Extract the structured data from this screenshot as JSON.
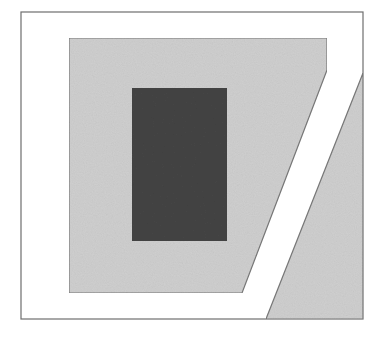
{
  "figure": {
    "colors": {
      "background": "#ffffff",
      "frame_stroke": "#6e6e6e",
      "light_fill": "#cfcfcf",
      "dark_fill": "#444444",
      "edge_stroke": "#7a7a7a"
    },
    "outer_frame": {
      "x": 21,
      "y": 12,
      "width": 342,
      "height": 307
    },
    "inner_shape_points": "69,38 327,38 327,70 242,293 69,293",
    "dark_rect": {
      "x": 132,
      "y": 88,
      "width": 95,
      "height": 153
    },
    "right_wedge_points": "363,73 363,319 266,319"
  }
}
